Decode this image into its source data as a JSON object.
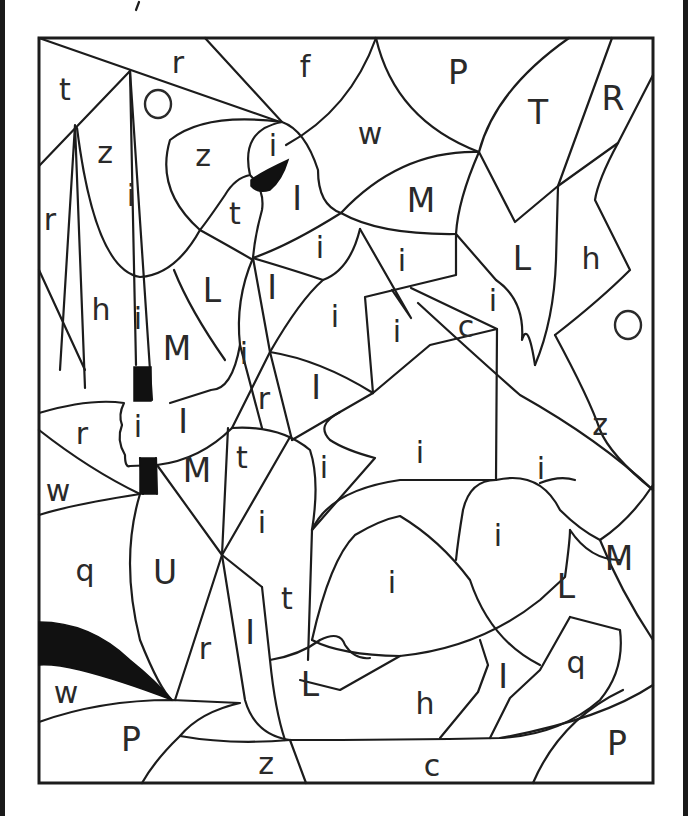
{
  "page": {
    "kind": "color-by-letter worksheet",
    "colors": {
      "line": "#1c1c1c",
      "fill_black": "#111111",
      "paper": "#ffffff"
    }
  },
  "labels": [
    {
      "t": "t",
      "x": 65,
      "y": 89
    },
    {
      "t": "r",
      "x": 178,
      "y": 62
    },
    {
      "t": "f",
      "x": 305,
      "y": 66
    },
    {
      "t": "P",
      "x": 458,
      "y": 72
    },
    {
      "t": "T",
      "x": 538,
      "y": 112
    },
    {
      "t": "R",
      "x": 613,
      "y": 98
    },
    {
      "t": "O",
      "x": 158,
      "y": 104,
      "ring": true
    },
    {
      "t": "z",
      "x": 105,
      "y": 152
    },
    {
      "t": "z",
      "x": 203,
      "y": 155
    },
    {
      "t": "i",
      "x": 273,
      "y": 145
    },
    {
      "t": "w",
      "x": 370,
      "y": 133
    },
    {
      "t": "i",
      "x": 131,
      "y": 195
    },
    {
      "t": "I",
      "x": 297,
      "y": 198
    },
    {
      "t": "t",
      "x": 235,
      "y": 213
    },
    {
      "t": "M",
      "x": 421,
      "y": 200
    },
    {
      "t": "r",
      "x": 50,
      "y": 219
    },
    {
      "t": "i",
      "x": 320,
      "y": 247
    },
    {
      "t": "i",
      "x": 402,
      "y": 260
    },
    {
      "t": "L",
      "x": 522,
      "y": 258
    },
    {
      "t": "h",
      "x": 591,
      "y": 258
    },
    {
      "t": "L",
      "x": 212,
      "y": 290
    },
    {
      "t": "I",
      "x": 272,
      "y": 287
    },
    {
      "t": "h",
      "x": 101,
      "y": 309
    },
    {
      "t": "i",
      "x": 138,
      "y": 318
    },
    {
      "t": "i",
      "x": 335,
      "y": 316
    },
    {
      "t": "i",
      "x": 397,
      "y": 331
    },
    {
      "t": "c",
      "x": 466,
      "y": 326
    },
    {
      "t": "i",
      "x": 493,
      "y": 300
    },
    {
      "t": "O",
      "x": 628,
      "y": 325,
      "ring": true
    },
    {
      "t": "M",
      "x": 177,
      "y": 348
    },
    {
      "t": "i",
      "x": 244,
      "y": 353
    },
    {
      "t": "r",
      "x": 264,
      "y": 398
    },
    {
      "t": "I",
      "x": 316,
      "y": 387
    },
    {
      "t": "I",
      "x": 183,
      "y": 421
    },
    {
      "t": "i",
      "x": 138,
      "y": 426
    },
    {
      "t": "r",
      "x": 82,
      "y": 433
    },
    {
      "t": "z",
      "x": 600,
      "y": 424
    },
    {
      "t": "i",
      "x": 420,
      "y": 452
    },
    {
      "t": "M",
      "x": 197,
      "y": 470
    },
    {
      "t": "t",
      "x": 242,
      "y": 457
    },
    {
      "t": "i",
      "x": 324,
      "y": 467
    },
    {
      "t": "i",
      "x": 541,
      "y": 468
    },
    {
      "t": "w",
      "x": 58,
      "y": 490
    },
    {
      "t": "i",
      "x": 262,
      "y": 522
    },
    {
      "t": "i",
      "x": 498,
      "y": 535
    },
    {
      "t": "q",
      "x": 85,
      "y": 570
    },
    {
      "t": "U",
      "x": 165,
      "y": 572
    },
    {
      "t": "M",
      "x": 619,
      "y": 558
    },
    {
      "t": "i",
      "x": 392,
      "y": 582
    },
    {
      "t": "L",
      "x": 566,
      "y": 586
    },
    {
      "t": "t",
      "x": 287,
      "y": 598
    },
    {
      "t": "I",
      "x": 250,
      "y": 632
    },
    {
      "t": "r",
      "x": 205,
      "y": 648
    },
    {
      "t": "q",
      "x": 576,
      "y": 662
    },
    {
      "t": "I",
      "x": 503,
      "y": 676
    },
    {
      "t": "L",
      "x": 310,
      "y": 684
    },
    {
      "t": "w",
      "x": 66,
      "y": 692
    },
    {
      "t": "h",
      "x": 425,
      "y": 703
    },
    {
      "t": "P",
      "x": 131,
      "y": 739
    },
    {
      "t": "P",
      "x": 617,
      "y": 743
    },
    {
      "t": "z",
      "x": 266,
      "y": 763
    },
    {
      "t": "c",
      "x": 432,
      "y": 765
    }
  ]
}
